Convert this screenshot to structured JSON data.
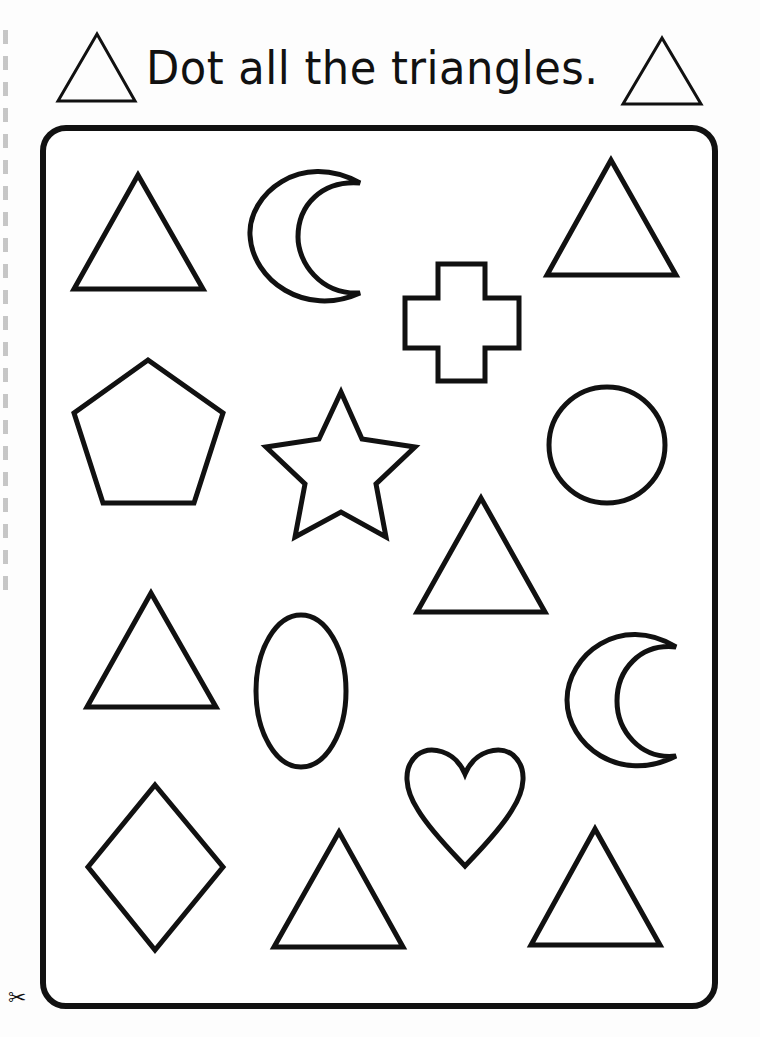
{
  "worksheet": {
    "title": "Dot all the triangles.",
    "title_icon_left": "triangle-icon",
    "title_icon_right": "triangle-icon",
    "cut_marker_icon": "scissors-icon",
    "cut_marker_glyph": "✂",
    "stroke_color": "#111111",
    "background_color": "#ffffff"
  },
  "shapes": [
    {
      "id": 1,
      "type": "triangle",
      "row": 1,
      "col": 1
    },
    {
      "id": 2,
      "type": "crescent-moon",
      "row": 1,
      "col": 2
    },
    {
      "id": 3,
      "type": "cross",
      "row": 1,
      "col": 3
    },
    {
      "id": 4,
      "type": "triangle",
      "row": 1,
      "col": 4
    },
    {
      "id": 5,
      "type": "pentagon",
      "row": 2,
      "col": 1
    },
    {
      "id": 6,
      "type": "star",
      "row": 2,
      "col": 2
    },
    {
      "id": 7,
      "type": "circle",
      "row": 2,
      "col": 4
    },
    {
      "id": 8,
      "type": "triangle",
      "row": 2,
      "col": 3
    },
    {
      "id": 9,
      "type": "triangle",
      "row": 3,
      "col": 1
    },
    {
      "id": 10,
      "type": "oval",
      "row": 3,
      "col": 2
    },
    {
      "id": 11,
      "type": "crescent-moon",
      "row": 3,
      "col": 4
    },
    {
      "id": 12,
      "type": "heart",
      "row": 3,
      "col": 3
    },
    {
      "id": 13,
      "type": "diamond",
      "row": 4,
      "col": 1
    },
    {
      "id": 14,
      "type": "triangle",
      "row": 4,
      "col": 2
    },
    {
      "id": 15,
      "type": "triangle",
      "row": 4,
      "col": 4
    }
  ],
  "triangle_count": 6
}
